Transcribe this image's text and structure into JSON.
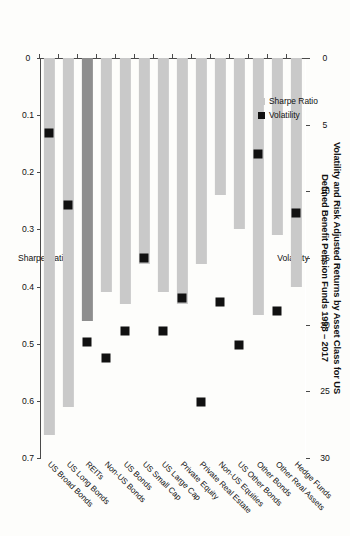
{
  "chart_data": {
    "type": "bar",
    "title": "Volatility and Risk Adjusted Returns by Asset Class for US",
    "subtitle": "Defined Benefit Pension Funds 1998 – 2017",
    "categories": [
      "Hedge Funds",
      "Other Real Assets",
      "Other Bonds",
      "US Other Bonds",
      "Non-US Equities",
      "Private Real Estate",
      "Private Equity",
      "US Large Cap",
      "US Small Cap",
      "US Bonds",
      "Non-US Bonds",
      "REITs",
      "US Long Bonds",
      "US Broad Bonds"
    ],
    "series": [
      {
        "name": "Sharpe Ratio",
        "axis": "bottom",
        "color": "#c9c9c9",
        "highlight_color": "#8e8e8e",
        "highlight_index": 11,
        "values": [
          0.4,
          0.31,
          0.45,
          0.3,
          0.24,
          0.36,
          0.43,
          0.41,
          0.36,
          0.43,
          0.41,
          0.46,
          0.61,
          0.66
        ]
      },
      {
        "name": "Volatility",
        "axis": "top",
        "color": "#111111",
        "marker": "square",
        "values": [
          11.6,
          19.0,
          7.2,
          21.5,
          18.3,
          25.8,
          18.0,
          20.5,
          15.0,
          20.5,
          22.5,
          21.3,
          11.0,
          5.6
        ]
      }
    ],
    "axes": {
      "top": {
        "label": "Volatility",
        "ticks": [
          "0",
          "5",
          "10",
          "15",
          "20",
          "25",
          "30"
        ],
        "tickvalues": [
          0,
          5,
          10,
          15,
          20,
          25,
          30
        ],
        "min": 0,
        "max": 30
      },
      "bottom": {
        "label": "Sharpe Ratio",
        "ticks": [
          "0",
          "0.1",
          "0.2",
          "0.3",
          "0.4",
          "0.5",
          "0.6",
          "0.7"
        ],
        "tickvalues": [
          0,
          0.1,
          0.2,
          0.3,
          0.4,
          0.5,
          0.6,
          0.7
        ],
        "min": 0,
        "max": 0.7
      }
    },
    "legend": {
      "position": "inside-upper-left",
      "entries": [
        {
          "label": "Sharpe Ratio",
          "swatch": "#c9c9c9"
        },
        {
          "label": "Volatility",
          "swatch": "#111111"
        }
      ]
    },
    "grid": false,
    "orientation": "rotated-90"
  }
}
